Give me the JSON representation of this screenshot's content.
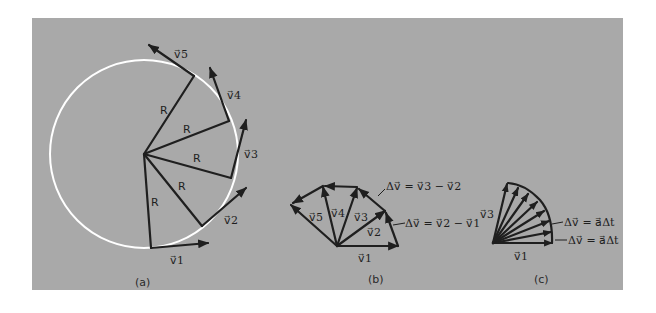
{
  "figure": {
    "background_color": "#a9a9a9",
    "circle_color": "#ffffff",
    "line_color": "#1f1f1f"
  },
  "panel_a": {
    "caption": "(a)",
    "radius_label": "R",
    "vectors": [
      {
        "label": "v⃗1",
        "name": "v1"
      },
      {
        "label": "v⃗2",
        "name": "v2"
      },
      {
        "label": "v⃗3",
        "name": "v3"
      },
      {
        "label": "v⃗4",
        "name": "v4"
      },
      {
        "label": "v⃗5",
        "name": "v5"
      }
    ],
    "r_labels": [
      "R",
      "R",
      "R",
      "R",
      "R"
    ]
  },
  "panel_b": {
    "caption": "(b)",
    "vectors": [
      "v⃗1",
      "v⃗2",
      "v⃗3",
      "v⃗4",
      "v⃗5"
    ],
    "annotations": [
      {
        "text": "Δv⃗ = v⃗3 − v⃗2"
      },
      {
        "text": "Δv⃗ = v⃗2 − v⃗1"
      }
    ]
  },
  "panel_c": {
    "caption": "(c)",
    "vectors": [
      "v⃗1",
      "v⃗3"
    ],
    "annotations": [
      {
        "text": "Δv⃗ = a⃗Δt"
      },
      {
        "text": "Δv⃗ = a⃗Δt"
      }
    ]
  }
}
